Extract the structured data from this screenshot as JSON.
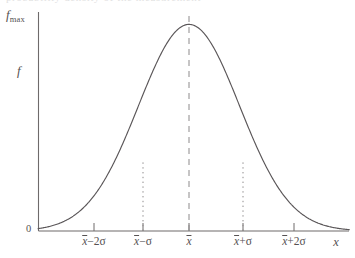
{
  "figure": {
    "background_color": "#ffffff",
    "ink_color": "#555152",
    "curve_color": "#5a5658",
    "top_bleed_text": "probability density of the measurement"
  },
  "axes": {
    "y_axis_top_label": {
      "base": "f",
      "subscript": "max"
    },
    "y_axis_label": "f",
    "y_origin_label": "0",
    "x_axis_label": "x"
  },
  "chart_data": {
    "type": "line",
    "title": "",
    "subtitle": "",
    "xlabel": "x",
    "ylabel": "f",
    "grid": false,
    "legend": null,
    "xlim": [
      -3.1,
      3.35
    ],
    "ylim": [
      0,
      1.06
    ],
    "x_tick_labels": [
      "x̄−2σ",
      "x̄−σ",
      "x̄",
      "x̄+σ",
      "x̄+2σ"
    ],
    "x_tick_values": [
      -2,
      -1,
      0,
      1,
      2
    ],
    "y_tick_labels": [
      "0",
      "f_max"
    ],
    "y_tick_values": [
      0,
      1
    ],
    "series": [
      {
        "name": "f(x) normal density",
        "formula": "f = f_max * exp(-(x - xbar)^2 / (2 sigma^2))",
        "x": [
          -3.1,
          -3.0,
          -2.8,
          -2.6,
          -2.4,
          -2.2,
          -2.0,
          -1.8,
          -1.6,
          -1.4,
          -1.2,
          -1.0,
          -0.8,
          -0.6,
          -0.4,
          -0.2,
          0.0,
          0.2,
          0.4,
          0.6,
          0.8,
          1.0,
          1.2,
          1.4,
          1.6,
          1.8,
          2.0,
          2.2,
          2.4,
          2.6,
          2.8,
          3.0,
          3.1
        ],
        "y": [
          0.008,
          0.011,
          0.019,
          0.034,
          0.056,
          0.089,
          0.135,
          0.198,
          0.278,
          0.375,
          0.487,
          0.607,
          0.726,
          0.835,
          0.923,
          0.98,
          1.0,
          0.98,
          0.923,
          0.835,
          0.726,
          0.607,
          0.487,
          0.375,
          0.278,
          0.198,
          0.135,
          0.089,
          0.056,
          0.034,
          0.019,
          0.011,
          0.008
        ]
      }
    ],
    "annotations": [
      {
        "name": "mean-line",
        "style": "dashed",
        "x": 0,
        "y_from": 0,
        "y_to": 1.0,
        "label": "x̄"
      },
      {
        "name": "minus-sigma-line",
        "style": "dotted",
        "x": -1,
        "y_from": 0,
        "y_to": 0.607,
        "label": "x̄−σ"
      },
      {
        "name": "plus-sigma-line",
        "style": "dotted",
        "x": 1,
        "y_from": 0,
        "y_to": 0.607,
        "label": "x̄+σ"
      }
    ]
  },
  "tick_marks": {
    "labels": [
      {
        "id": "minus-2-sigma",
        "mean": "x",
        "operator": "−2",
        "sigma": "σ"
      },
      {
        "id": "minus-1-sigma",
        "mean": "x",
        "operator": "−",
        "sigma": "σ"
      },
      {
        "id": "mean",
        "mean": "x",
        "operator": "",
        "sigma": ""
      },
      {
        "id": "plus-1-sigma",
        "mean": "x",
        "operator": "+",
        "sigma": "σ"
      },
      {
        "id": "plus-2-sigma",
        "mean": "x",
        "operator": "+2",
        "sigma": "σ"
      }
    ]
  }
}
